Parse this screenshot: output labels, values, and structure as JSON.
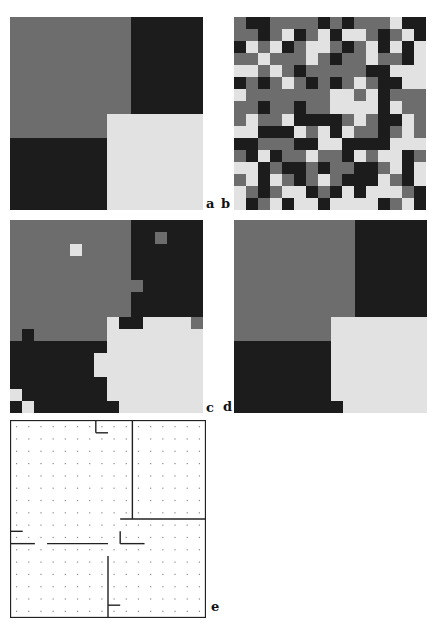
{
  "figure": {
    "palette": {
      "G": "#6d6d6d",
      "B": "#1c1c1c",
      "L": "#e2e2e2"
    },
    "grid_size": 16,
    "panels": [
      {
        "id": "a",
        "label": "a",
        "description": "true labeling",
        "rows": [
          "GGGGGGGGGGBBBBBB",
          "GGGGGGGGGGBBBBBB",
          "GGGGGGGGGGBBBBBB",
          "GGGGGGGGGGBBBBBB",
          "GGGGGGGGGGBBBBBB",
          "GGGGGGGGGGBBBBBB",
          "GGGGGGGGGGBBBBBB",
          "GGGGGGGGGGBBBBBB",
          "GGGGGGGGLLLLLLLL",
          "GGGGGGGGLLLLLLLL",
          "BBBBBBBBLLLLLLLL",
          "BBBBBBBBLLLLLLLL",
          "BBBBBBBBLLLLLLLL",
          "BBBBBBBBLLLLLLLL",
          "BBBBBBBBLLLLLLLL",
          "BBBBBBBBLLLLLLLL"
        ]
      },
      {
        "id": "b",
        "label": "b",
        "description": "noisy observation",
        "rows": [
          "GBBGGGGBGBGGGLBB",
          "GGBGLBGLBLLGBGLB",
          "BLGLBGLLGBGLBLBL",
          "GGLGGGLGBGGLGGBL",
          "LLGLGBGGGGGBBLLL",
          "BGBGLGBGBGLGBBLL",
          "LGGGGGGGLLGLBGGG",
          "GGBGGBGGLLLLBLGG",
          "GLGGLBBBBGLGBBLG",
          "LLBBBLGLBLGGBGLG",
          "BBGGGBBLLBBBBLLL",
          "GBLBGGLGGBLGLLBG",
          "LLBGBBGBGGBBGLBL",
          "GLBLGBGLGBBBLGBL",
          "LGBGLLBGBLBLLLGB",
          "LBGLBLLBLLLLBGLB"
        ]
      },
      {
        "id": "c",
        "label": "c",
        "description": "restoration estimate",
        "rows": [
          "GGGGGGGGGGBBBBBB",
          "GGGGGGGGGGBBGBBB",
          "GGGGGLGGGGBBBBBB",
          "GGGGGGGGGGBBBBBB",
          "GGGGGGGGGGBBBBBB",
          "GGGGGGGGGGGBBBBB",
          "GGGGGGGGGGBBBBBB",
          "GGGGGGGGGGBBBBBB",
          "GGGGGGGGLBBLLLLG",
          "GBGGGGGGLLLLLLLL",
          "BBBBBBBBLLLLLLLL",
          "BBBBBBBLLLLLLLLL",
          "BBBBBBBLLLLLLLLL",
          "BBBBBBBBLLLLLLLL",
          "LBBBBBBBLLLLLLLL",
          "BLBBBBBBBLLLLLLL"
        ]
      },
      {
        "id": "d",
        "label": "d",
        "description": "restoration estimate",
        "rows": [
          "GGGGGGGGGGBBBBBB",
          "GGGGGGGGGGBBBBBB",
          "GGGGGGGGGGBBBBBB",
          "GGGGGGGGGGBBBBBB",
          "GGGGGGGGGGBBBBBB",
          "GGGGGGGGGGBBBBBB",
          "GGGGGGGGGGBBBBBB",
          "GGGGGGGGGGBBBBBB",
          "GGGGGGGGLLLLLLLL",
          "GGGGGGGGLLLLLLLL",
          "BBBBBBBBLLLLLLLL",
          "BBBBBBBBLLLLLLLL",
          "BBBBBBBBLLLLLLLL",
          "BBBBBBBBLLLLLLLL",
          "BBBBBBBBLLLLLLLL",
          "BBBBBBBBBLLLLLLL"
        ]
      }
    ],
    "boundary_panel": {
      "id": "e",
      "label": "e",
      "description": "estimated boundary map on 16x16 lattice (dots = pixel sites)",
      "segments": [
        [
          7,
          0,
          7,
          1
        ],
        [
          7,
          1,
          8,
          1
        ],
        [
          10,
          0,
          10,
          8
        ],
        [
          9,
          8,
          16,
          8
        ],
        [
          0,
          9,
          1,
          9
        ],
        [
          0,
          10,
          2,
          10
        ],
        [
          3,
          10,
          8,
          10
        ],
        [
          9,
          9,
          9,
          10
        ],
        [
          9,
          10,
          11,
          10
        ],
        [
          8,
          11,
          8,
          16
        ],
        [
          8,
          15,
          9,
          15
        ]
      ]
    }
  }
}
